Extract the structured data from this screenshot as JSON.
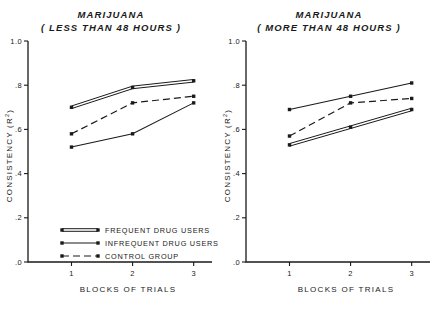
{
  "figure": {
    "width": 440,
    "height": 316,
    "background": "#ffffff",
    "ink_color": "#1a1a1a"
  },
  "axes": {
    "y_label_main": "CONSISTENCY",
    "y_label_paren": "(R",
    "y_label_sup": "2",
    "y_label_close": ")",
    "x_label": "BLOCKS OF TRIALS",
    "y_ticks": [
      "1.0",
      ".8",
      ".6",
      ".4",
      ".2",
      ".0"
    ],
    "y_tick_values": [
      1.0,
      0.8,
      0.6,
      0.4,
      0.2,
      0.0
    ],
    "x_ticks": [
      "1",
      "2",
      "3"
    ],
    "x_tick_values": [
      1,
      2,
      3
    ]
  },
  "legend": {
    "position": "lower-left-of-left-panel",
    "items": [
      {
        "label": "FREQUENT DRUG USERS",
        "style": "double-solid"
      },
      {
        "label": "INFREQUENT DRUG USERS",
        "style": "single-solid"
      },
      {
        "label": "CONTROL GROUP",
        "style": "dashed"
      }
    ]
  },
  "chart_data": [
    {
      "type": "line",
      "panel": "left",
      "title": "MARIJUANA",
      "subtitle": "( LESS THAN 48 HOURS )",
      "xlabel": "BLOCKS OF TRIALS",
      "ylabel": "CONSISTENCY (R2)",
      "categories": [
        "1",
        "2",
        "3"
      ],
      "x": [
        1,
        2,
        3
      ],
      "xlim": [
        0.55,
        3.3
      ],
      "ylim": [
        0.0,
        1.0
      ],
      "grid": false,
      "legend": "inside lower-left",
      "series": [
        {
          "name": "FREQUENT DRUG USERS",
          "style": "double-solid",
          "values": [
            0.7,
            0.79,
            0.82
          ]
        },
        {
          "name": "INFREQUENT DRUG USERS",
          "style": "single-solid",
          "values": [
            0.52,
            0.58,
            0.72
          ]
        },
        {
          "name": "CONTROL GROUP",
          "style": "dashed",
          "values": [
            0.58,
            0.72,
            0.75
          ]
        }
      ]
    },
    {
      "type": "line",
      "panel": "right",
      "title": "MARIJUANA",
      "subtitle": "( MORE THAN 48 HOURS )",
      "xlabel": "BLOCKS OF TRIALS",
      "ylabel": "CONSISTENCY (R2)",
      "categories": [
        "1",
        "2",
        "3"
      ],
      "x": [
        1,
        2,
        3
      ],
      "xlim": [
        0.55,
        3.3
      ],
      "ylim": [
        0.0,
        1.0
      ],
      "grid": false,
      "legend": "none",
      "series": [
        {
          "name": "FREQUENT DRUG USERS",
          "style": "double-solid",
          "values": [
            0.53,
            0.61,
            0.69
          ]
        },
        {
          "name": "INFREQUENT DRUG USERS",
          "style": "single-solid",
          "values": [
            0.69,
            0.75,
            0.81
          ]
        },
        {
          "name": "CONTROL GROUP",
          "style": "dashed",
          "values": [
            0.57,
            0.72,
            0.74
          ]
        }
      ]
    }
  ]
}
